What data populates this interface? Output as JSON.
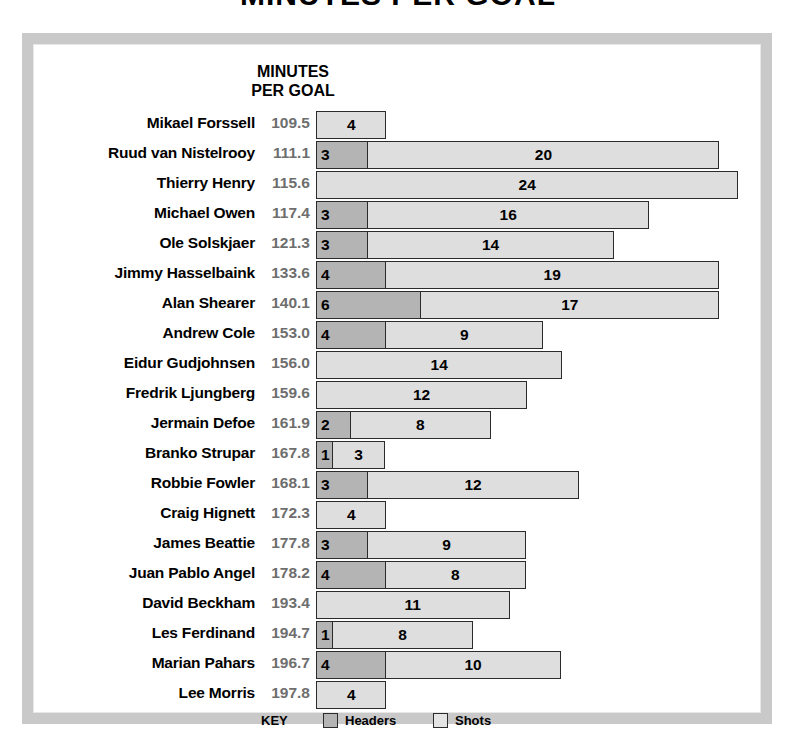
{
  "title": "MINUTES PER GOAL",
  "column_header": "MINUTES\nPER GOAL",
  "column_header_line1": "MINUTES",
  "column_header_line2": "PER GOAL",
  "legend": {
    "key_label": "KEY",
    "headers_label": "Headers",
    "shots_label": "Shots"
  },
  "colors": {
    "headers": "#b4b4b4",
    "shots": "#dedede",
    "outline": "#2b2b2b",
    "frame": "#c9c9c9",
    "mpg_text": "#6e6e6e"
  },
  "chart_data": {
    "type": "bar",
    "orientation": "horizontal",
    "stacked": true,
    "title": "MINUTES PER GOAL",
    "xlabel": "",
    "ylabel": "",
    "value_column_header": "MINUTES PER GOAL",
    "grid": false,
    "legend_position": "bottom",
    "units_per_pixel": 17.6,
    "categories": [
      "Mikael Forssell",
      "Ruud van Nistelrooy",
      "Thierry Henry",
      "Michael Owen",
      "Ole Solskjaer",
      "Jimmy Hasselbaink",
      "Alan Shearer",
      "Andrew Cole",
      "Eidur Gudjohnsen",
      "Fredrik Ljungberg",
      "Jermain Defoe",
      "Branko Strupar",
      "Robbie Fowler",
      "Craig Hignett",
      "James Beattie",
      "Juan Pablo Angel",
      "David Beckham",
      "Les Ferdinand",
      "Marian Pahars",
      "Lee Morris"
    ],
    "series": [
      {
        "name": "Headers",
        "values": [
          0,
          3,
          0,
          3,
          3,
          4,
          6,
          4,
          0,
          0,
          2,
          1,
          3,
          0,
          3,
          4,
          0,
          1,
          4,
          0
        ]
      },
      {
        "name": "Shots",
        "values": [
          4,
          20,
          24,
          16,
          14,
          19,
          17,
          9,
          14,
          12,
          8,
          3,
          12,
          4,
          9,
          8,
          11,
          8,
          10,
          4
        ]
      }
    ],
    "minutes_per_goal": [
      "109.5",
      "111.1",
      "115.6",
      "117.4",
      "121.3",
      "133.6",
      "140.1",
      "153.0",
      "156.0",
      "159.6",
      "161.9",
      "167.8",
      "168.1",
      "172.3",
      "177.8",
      "178.2",
      "193.4",
      "194.7",
      "196.7",
      "197.8"
    ]
  }
}
